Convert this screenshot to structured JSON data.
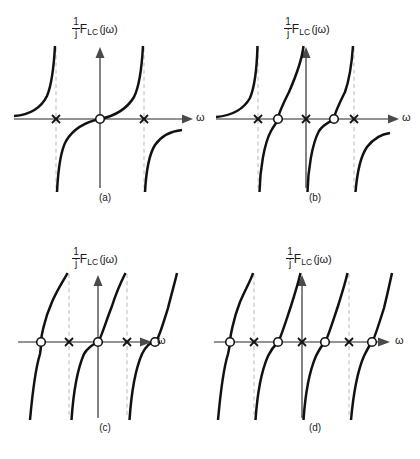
{
  "figure": {
    "kind": "reactance-function-plots",
    "axis_label_y": {
      "fraction_numerator": "1",
      "fraction_denominator": "j",
      "function": "F",
      "function_subscript": "LC",
      "argument": "(jω)"
    },
    "axis_label_x": "ω",
    "icons": {
      "zero_marker": "circle-open-icon",
      "pole_marker": "cross-x-icon",
      "axis_arrow": "arrow-right-icon",
      "axis_arrow_up": "arrow-up-icon"
    },
    "colors": {
      "curve": "#111111",
      "axis": "#6e6e6e",
      "asymptote": "#b9b9b9",
      "background": "#ffffff"
    }
  },
  "panels": [
    {
      "id": "a",
      "caption": "(a)",
      "zeros_at_origin": true,
      "poles_at_origin": false,
      "origin_marker": "zero",
      "markers": [
        {
          "type": "pole",
          "x": -0.5,
          "label": "x"
        },
        {
          "type": "zero",
          "x": 0.0,
          "label": "o"
        },
        {
          "type": "pole",
          "x": 0.5,
          "label": "x"
        }
      ],
      "asymptotes": [
        -0.5,
        0.5
      ],
      "branches": 3
    },
    {
      "id": "b",
      "caption": "(b)",
      "zeros_at_origin": false,
      "poles_at_origin": true,
      "origin_marker": "pole",
      "markers": [
        {
          "type": "pole",
          "x": -0.62,
          "label": "x"
        },
        {
          "type": "zero",
          "x": -0.28,
          "label": "o"
        },
        {
          "type": "pole",
          "x": 0.0,
          "label": "x"
        },
        {
          "type": "zero",
          "x": 0.28,
          "label": "o"
        },
        {
          "type": "pole",
          "x": 0.62,
          "label": "x"
        }
      ],
      "asymptotes": [
        -0.62,
        0.0,
        0.62
      ],
      "branches": 4
    },
    {
      "id": "c",
      "caption": "(c)",
      "zeros_at_origin": true,
      "poles_at_origin": false,
      "origin_marker": "zero",
      "markers": [
        {
          "type": "zero",
          "x": -0.62,
          "label": "o"
        },
        {
          "type": "pole",
          "x": -0.31,
          "label": "x"
        },
        {
          "type": "zero",
          "x": 0.0,
          "label": "o"
        },
        {
          "type": "pole",
          "x": 0.31,
          "label": "x"
        },
        {
          "type": "zero",
          "x": 0.62,
          "label": "o"
        }
      ],
      "asymptotes": [
        -0.31,
        0.31
      ],
      "branches": 3
    },
    {
      "id": "d",
      "caption": "(d)",
      "zeros_at_origin": false,
      "poles_at_origin": true,
      "origin_marker": "pole",
      "markers": [
        {
          "type": "zero",
          "x": -0.78,
          "label": "o"
        },
        {
          "type": "pole",
          "x": -0.56,
          "label": "x"
        },
        {
          "type": "zero",
          "x": -0.3,
          "label": "o"
        },
        {
          "type": "pole",
          "x": 0.0,
          "label": "x"
        },
        {
          "type": "zero",
          "x": 0.3,
          "label": "o"
        },
        {
          "type": "pole",
          "x": 0.56,
          "label": "x"
        },
        {
          "type": "zero",
          "x": 0.78,
          "label": "o"
        }
      ],
      "asymptotes": [
        -0.56,
        0.0,
        0.56
      ],
      "branches": 4
    }
  ]
}
